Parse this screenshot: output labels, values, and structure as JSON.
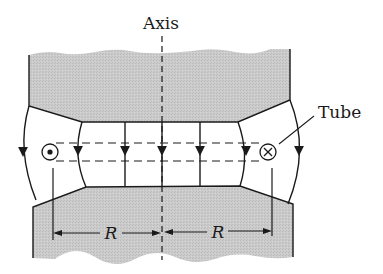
{
  "diagram": {
    "labels": {
      "axis": "Axis",
      "tube": "Tube",
      "radius_left": "R",
      "radius_right": "R"
    },
    "symbols": {
      "left_tube_current": "dot-out-of-page",
      "right_tube_current": "cross-into-page"
    },
    "colors": {
      "pole_fill": "#c9c9c9",
      "line": "#1a1a1a",
      "background": "#ffffff"
    }
  }
}
